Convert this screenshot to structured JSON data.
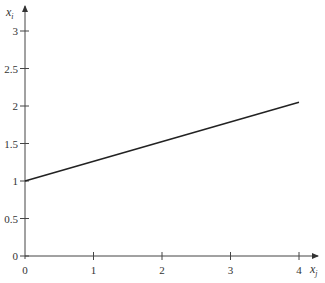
{
  "chart_data": {
    "type": "line",
    "title": "",
    "xlabel": "x_j",
    "ylabel": "x_i",
    "x_ticks": [
      "0",
      "1",
      "2",
      "3",
      "4"
    ],
    "y_ticks": [
      "0",
      "0.5",
      "1",
      "1.5",
      "2",
      "2.5",
      "3"
    ],
    "xlim": [
      0,
      4.3
    ],
    "ylim": [
      0,
      3.3
    ],
    "grid": false,
    "legend": null,
    "series": [
      {
        "name": "line",
        "x": [
          0,
          4
        ],
        "y": [
          1,
          2.05
        ]
      }
    ]
  },
  "labels": {
    "x_axis_var": "x",
    "x_axis_sub": "j",
    "y_axis_var": "x",
    "y_axis_sub": "i"
  }
}
